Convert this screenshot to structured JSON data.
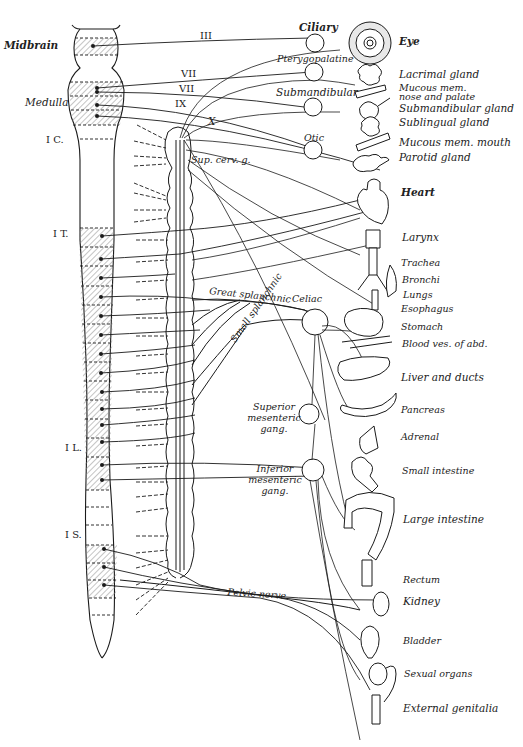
{
  "figure": {
    "colors": {
      "ink": "#1a1a1a",
      "hatch": "#8a8a8a",
      "background": "#ffffff"
    }
  },
  "cns_labels": {
    "midbrain": "Midbrain",
    "medulla": "Medulla",
    "cervical": "I C.",
    "thoracic": "I T.",
    "lumbar": "I L.",
    "sacral": "I S."
  },
  "cranial_nerves": {
    "III": "III",
    "VII_a": "VII",
    "VII_b": "VII",
    "IX": "IX",
    "X": "X"
  },
  "ganglia": {
    "ciliary": "Ciliary",
    "pterygopalatine": "Pterygopalatine",
    "submandibular": "Submandibular",
    "otic": "Otic",
    "sup_cerv": "Sup. cerv. g.",
    "celiac": "Celiac",
    "superior_mesenteric": [
      "Superior",
      "mesenteric",
      "gang."
    ],
    "inferior_mesenteric": [
      "Inferior",
      "mesenteric",
      "gang."
    ]
  },
  "nerves": {
    "great_splanchnic": "Great splanchnic",
    "small_splanchnic": "Small splanchnic",
    "pelvic": "Pelvic nerve"
  },
  "organs": [
    {
      "id": "eye",
      "label": "Eye"
    },
    {
      "id": "lacrimal",
      "label": "Lacrimal gland"
    },
    {
      "id": "mucous_nose_1",
      "label": "Mucous mem."
    },
    {
      "id": "mucous_nose_2",
      "label": "nose and palate"
    },
    {
      "id": "submandibular_gland",
      "label": "Submandibular gland"
    },
    {
      "id": "sublingual",
      "label": "Sublingual gland"
    },
    {
      "id": "mucous_mouth",
      "label": "Mucous mem. mouth"
    },
    {
      "id": "parotid",
      "label": "Parotid gland"
    },
    {
      "id": "heart",
      "label": "Heart"
    },
    {
      "id": "larynx",
      "label": "Larynx"
    },
    {
      "id": "trachea",
      "label": "Trachea"
    },
    {
      "id": "bronchi",
      "label": "Bronchi"
    },
    {
      "id": "lungs",
      "label": "Lungs"
    },
    {
      "id": "esophagus",
      "label": "Esophagus"
    },
    {
      "id": "stomach",
      "label": "Stomach"
    },
    {
      "id": "blood_vessels",
      "label": "Blood ves. of abd."
    },
    {
      "id": "liver",
      "label": "Liver and ducts"
    },
    {
      "id": "pancreas",
      "label": "Pancreas"
    },
    {
      "id": "adrenal",
      "label": "Adrenal"
    },
    {
      "id": "small_intestine",
      "label": "Small intestine"
    },
    {
      "id": "large_intestine",
      "label": "Large intestine"
    },
    {
      "id": "rectum",
      "label": "Rectum"
    },
    {
      "id": "kidney",
      "label": "Kidney"
    },
    {
      "id": "bladder",
      "label": "Bladder"
    },
    {
      "id": "sexual_organs",
      "label": "Sexual organs"
    },
    {
      "id": "external_genitalia",
      "label": "External genitalia"
    }
  ]
}
